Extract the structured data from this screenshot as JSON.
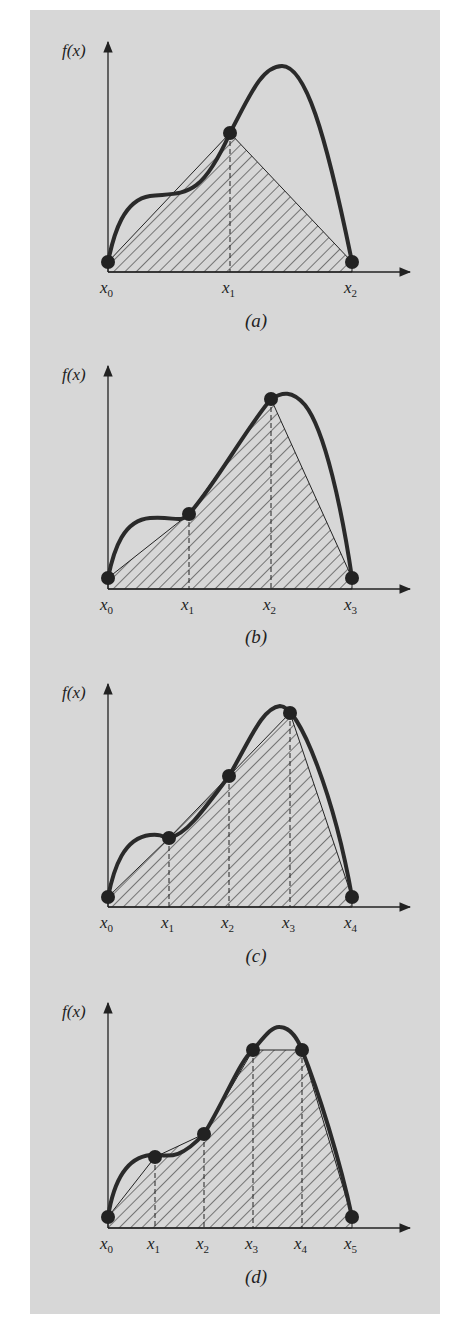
{
  "figure": {
    "background_color": "#d7d7d7",
    "ink_color": "#222222",
    "y_axis_label": "f(x)",
    "panels": [
      {
        "id": "a",
        "caption": "(a)",
        "node_labels": [
          "x0",
          "x1",
          "x2"
        ],
        "axis": {
          "x0": 108,
          "y": 272,
          "x_end": 410,
          "y_top": 42
        },
        "nodes": [
          [
            108,
            262
          ],
          [
            230,
            133
          ],
          [
            352,
            262
          ]
        ],
        "curve": "M108,262 C114,232 124,200 150,196 C185,192 200,200 230,133 C250,95 262,66 282,66 C305,66 325,130 352,262",
        "label_y": 293,
        "caption_pos": [
          256,
          327
        ]
      },
      {
        "id": "b",
        "caption": "(b)",
        "node_labels": [
          "x0",
          "x1",
          "x2",
          "x3"
        ],
        "axis": {
          "x0": 108,
          "y": 589,
          "x_end": 410,
          "y_top": 366
        },
        "nodes": [
          [
            108,
            578
          ],
          [
            189,
            514
          ],
          [
            271,
            399
          ],
          [
            352,
            578
          ]
        ],
        "curve": "M108,578 C114,548 124,520 150,518 C175,516 180,524 189,514 C215,485 245,430 271,399 C282,392 292,390 305,405 C325,430 342,510 352,578",
        "label_y": 610,
        "caption_pos": [
          256,
          643
        ]
      },
      {
        "id": "c",
        "caption": "(c)",
        "node_labels": [
          "x0",
          "x1",
          "x2",
          "x3",
          "x4"
        ],
        "axis": {
          "x0": 108,
          "y": 907,
          "x_end": 410,
          "y_top": 684
        },
        "nodes": [
          [
            108,
            897
          ],
          [
            169,
            838
          ],
          [
            229,
            776
          ],
          [
            290,
            713
          ],
          [
            352,
            897
          ]
        ],
        "curve": "M108,897 C114,867 124,838 150,835 C165,833 165,840 169,838 C185,835 200,815 229,776 C250,740 262,708 280,706 C300,706 335,800 352,897",
        "label_y": 928,
        "caption_pos": [
          256,
          962
        ]
      },
      {
        "id": "d",
        "caption": "(d)",
        "node_labels": [
          "x0",
          "x1",
          "x2",
          "x3",
          "x4",
          "x5"
        ],
        "axis": {
          "x0": 108,
          "y": 1228,
          "x_end": 410,
          "y_top": 1003
        },
        "nodes": [
          [
            108,
            1217
          ],
          [
            155,
            1157
          ],
          [
            204,
            1134
          ],
          [
            253,
            1050
          ],
          [
            302,
            1050
          ],
          [
            352,
            1217
          ]
        ],
        "curve": "M108,1217 C113,1185 125,1158 150,1155 C165,1153 175,1165 204,1134 C225,1100 240,1060 253,1050 C265,1036 272,1026 280,1027 C292,1028 298,1040 302,1050 C318,1090 340,1160 352,1217",
        "label_y": 1249,
        "caption_pos": [
          256,
          1283
        ]
      }
    ]
  }
}
